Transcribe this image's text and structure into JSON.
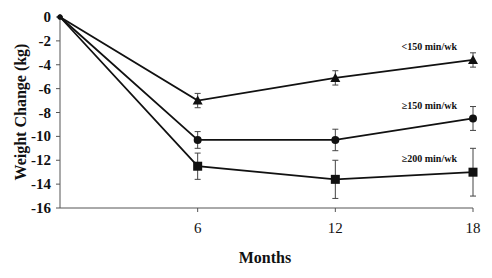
{
  "chart_data": {
    "type": "line",
    "title": "",
    "xlabel": "Months",
    "ylabel": "Weight Change (kg)",
    "x": [
      0,
      6,
      12,
      18
    ],
    "x_ticks": [
      6,
      12,
      18
    ],
    "x_tick_labels": [
      "6",
      "12",
      "18"
    ],
    "xlim": [
      0,
      18
    ],
    "y_ticks": [
      0,
      -2,
      -4,
      -6,
      -8,
      -10,
      -12,
      -14,
      -16
    ],
    "y_tick_labels": [
      "0",
      "-2",
      "-4",
      "-6",
      "-8",
      "-10",
      "-12",
      "-14",
      "-16"
    ],
    "ylim": [
      -16,
      0
    ],
    "grid": false,
    "legend": "inline labels at right",
    "series": [
      {
        "name": "<150 min/wk",
        "label": "<150 min/wk",
        "marker": "triangle",
        "values": [
          0,
          -7.0,
          -5.1,
          -3.6
        ],
        "error": [
          0,
          0.6,
          0.6,
          0.6
        ]
      },
      {
        "name": "≥150 min/wk",
        "label": "≥150 min/wk",
        "marker": "circle",
        "values": [
          0,
          -10.3,
          -10.3,
          -8.5
        ],
        "error": [
          0,
          0.7,
          0.9,
          1.0
        ]
      },
      {
        "name": "≥200 min/wk",
        "label": "≥200 min/wk",
        "marker": "square",
        "values": [
          0,
          -12.5,
          -13.6,
          -13.0
        ],
        "error": [
          0,
          1.1,
          1.6,
          2.0
        ]
      }
    ]
  },
  "colors": {
    "line": "#111111",
    "axis": "#555555",
    "background": "#ffffff"
  }
}
